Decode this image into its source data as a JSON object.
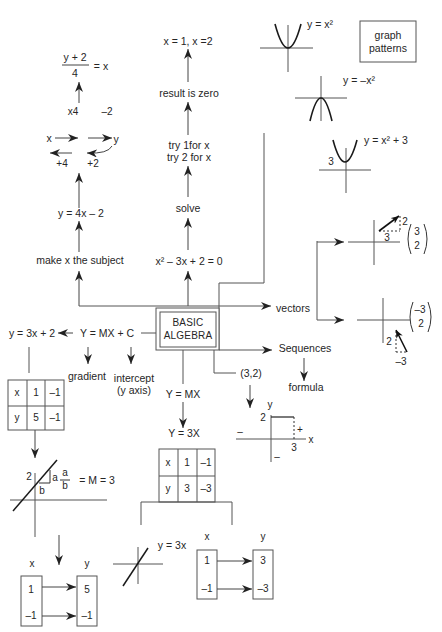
{
  "center": {
    "line1": "BASIC",
    "line2": "ALGEBRA"
  },
  "graph_patterns": {
    "label_line1": "graph",
    "label_line2": "patterns",
    "parabola": "y = x²",
    "inverted_parabola": "y = –x²",
    "shifted_parabola": "y = x² + 3",
    "shift_value": "3"
  },
  "rearranging": {
    "fraction_numerator": "y + 2",
    "fraction_denominator": "4",
    "fraction_rhs": "= x",
    "forward_ops": [
      "x4",
      "–2"
    ],
    "flow_input": "x",
    "flow_output": "y",
    "inverse_ops": [
      "+4",
      "+2"
    ],
    "equation": "y = 4x – 2",
    "step": "make x the subject"
  },
  "quadratic": {
    "result": "x = 1, x =2",
    "zero": "result is zero",
    "try_1": "try 1for x",
    "try_2": "try 2 for x",
    "solve": "solve",
    "equation": "x² – 3x + 2 = 0"
  },
  "vectors": {
    "label": "vectors",
    "v1": {
      "top": "3",
      "bottom": "2",
      "dx": "3",
      "dy": "2"
    },
    "v2": {
      "top": "–3",
      "bottom": "2",
      "dx": "–3",
      "dy": "2"
    }
  },
  "sequences": {
    "label": "Sequences",
    "formula": "formula"
  },
  "coordinates": {
    "label": "(3,2)",
    "y_axis": "y",
    "x_axis": "x",
    "y_value": "2",
    "x_value": "3",
    "plus": "+",
    "minus_x": "–",
    "minus_y": "–"
  },
  "linear": {
    "general": "Y = MX + C",
    "example": "y = 3x + 2",
    "gradient": "gradient",
    "intercept": "intercept",
    "intercept_note": "(y axis)",
    "table": {
      "rows": [
        [
          "x",
          "1",
          "–1"
        ],
        [
          "y",
          "5",
          "–1"
        ]
      ]
    },
    "graph": {
      "intercept_value": "2",
      "side_a": "a",
      "side_b": "b",
      "frac_num": "a",
      "frac_den": "b",
      "frac_rhs": "= M = 3"
    },
    "mapping": {
      "x_label": "x",
      "y_label": "y",
      "inputs": [
        "1",
        "–1"
      ],
      "outputs": [
        "5",
        "–1"
      ]
    }
  },
  "proportional": {
    "general": "Y = MX",
    "example": "Y = 3X",
    "table": {
      "rows": [
        [
          "x",
          "1",
          "–1"
        ],
        [
          "y",
          "3",
          "–3"
        ]
      ]
    },
    "graph_label": "y = 3x",
    "mapping": {
      "x_label": "x",
      "y_label": "y",
      "inputs": [
        "1",
        "–1"
      ],
      "outputs": [
        "3",
        "–3"
      ]
    }
  },
  "colors": {
    "ink": "#262626",
    "connector": "#555555",
    "curve": "#1a1a1a"
  }
}
